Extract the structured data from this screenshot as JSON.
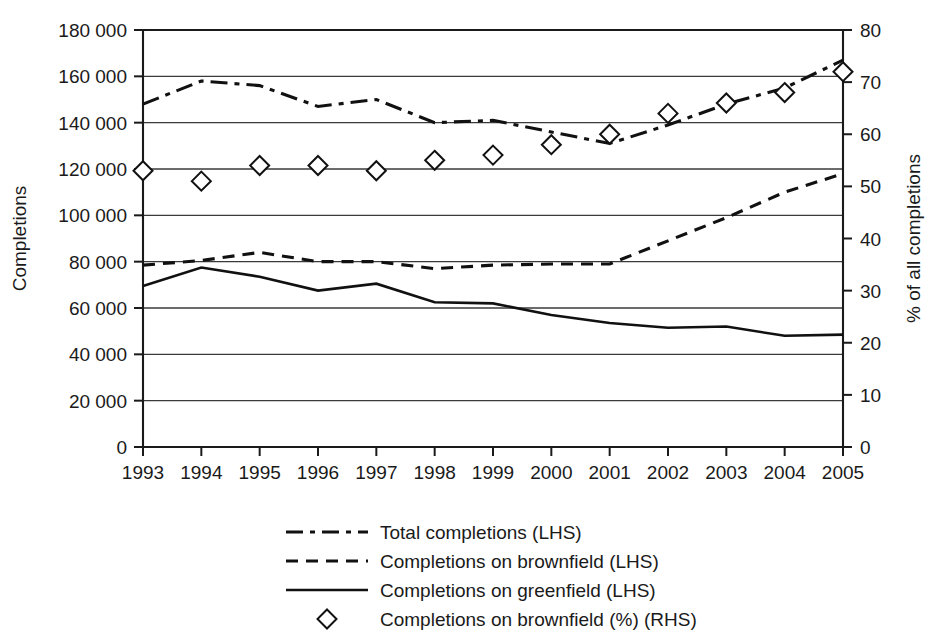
{
  "chart_data": {
    "type": "line",
    "title": "",
    "xlabel": "",
    "ylabel": "Completions",
    "y2label": "% of all completions",
    "categories": [
      "1993",
      "1994",
      "1995",
      "1996",
      "1997",
      "1998",
      "1999",
      "2000",
      "2001",
      "2002",
      "2003",
      "2004",
      "2005"
    ],
    "x": [
      1993,
      1994,
      1995,
      1996,
      1997,
      1998,
      1999,
      2000,
      2001,
      2002,
      2003,
      2004,
      2005
    ],
    "ylim": [
      0,
      180000
    ],
    "y2lim": [
      0,
      80
    ],
    "yticks": [
      0,
      20000,
      40000,
      60000,
      80000,
      100000,
      120000,
      140000,
      160000,
      180000
    ],
    "ytick_labels": [
      "0",
      "20 000",
      "40 000",
      "60 000",
      "80 000",
      "100 000",
      "120 000",
      "140 000",
      "160 000",
      "180 000"
    ],
    "y2ticks": [
      0,
      10,
      20,
      30,
      40,
      50,
      60,
      70,
      80
    ],
    "y2tick_labels": [
      "0",
      "10",
      "20",
      "30",
      "40",
      "50",
      "60",
      "70",
      "80"
    ],
    "grid": true,
    "legend_position": "bottom",
    "series": [
      {
        "name": "Total completions (LHS)",
        "axis": "left",
        "style": "dash-dot",
        "marker": "none",
        "values": [
          148000,
          158000,
          156000,
          147000,
          150000,
          140000,
          141000,
          136000,
          131000,
          139000,
          148000,
          155000,
          167000
        ]
      },
      {
        "name": "Completions on brownfield (LHS)",
        "axis": "left",
        "style": "dashed",
        "marker": "none",
        "values": [
          78500,
          80500,
          84000,
          80000,
          80000,
          77000,
          78500,
          79000,
          79000,
          89000,
          99000,
          110000,
          118000
        ]
      },
      {
        "name": "Completions on greenfield (LHS)",
        "axis": "left",
        "style": "solid",
        "marker": "none",
        "values": [
          69500,
          77500,
          73500,
          67500,
          70500,
          62500,
          62000,
          57000,
          53500,
          51500,
          52000,
          48000,
          48500
        ]
      },
      {
        "name": "Completions on brownfield (%) (RHS)",
        "axis": "right",
        "style": "none",
        "marker": "diamond",
        "values": [
          53,
          51,
          54,
          54,
          53,
          55,
          56,
          58,
          60,
          64,
          66,
          68,
          72
        ]
      }
    ]
  },
  "legend": {
    "items": [
      {
        "label": "Total completions (LHS)",
        "style": "dash-dot"
      },
      {
        "label": "Completions on brownfield (LHS)",
        "style": "dashed"
      },
      {
        "label": "Completions on greenfield (LHS)",
        "style": "solid"
      },
      {
        "label": "Completions on brownfield (%) (RHS)",
        "style": "diamond"
      }
    ]
  }
}
